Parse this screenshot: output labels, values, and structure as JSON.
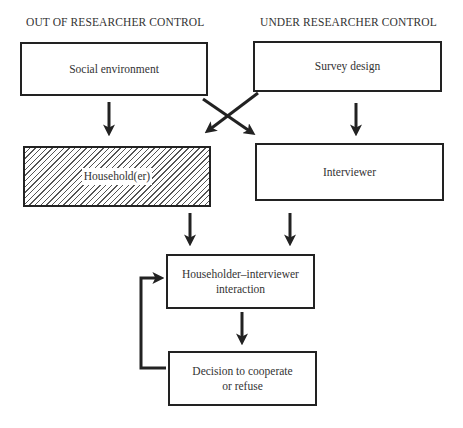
{
  "headings": {
    "left": "OUT OF RESEARCHER CONTROL",
    "right": "UNDER RESEARCHER CONTROL"
  },
  "boxes": {
    "social_environment": "Social environment",
    "survey_design": "Survey design",
    "householder": "Household(er)",
    "interviewer": "Interviewer",
    "interaction_line1": "Householder–interviewer",
    "interaction_line2": "interaction",
    "decision_line1": "Decision to cooperate",
    "decision_line2": "or refuse"
  },
  "colors": {
    "line": "#222222",
    "hatch": "#555555",
    "background": "#ffffff"
  }
}
